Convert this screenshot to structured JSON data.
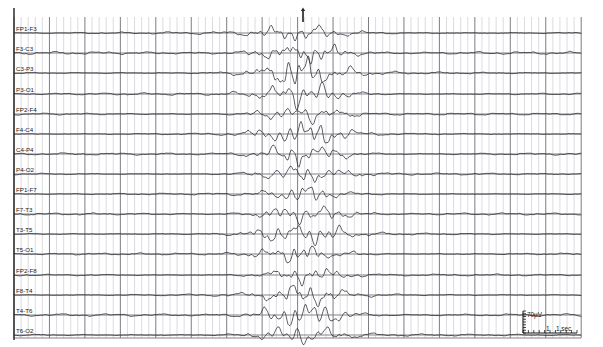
{
  "recording": {
    "title": "EEG trace page",
    "left_border_x": 14,
    "grid": {
      "x0": 14,
      "x1": 581,
      "y0": 17,
      "y1": 338,
      "minor_step_x": 7.09,
      "major_every_x": 5,
      "row_height": 20.07,
      "minor_color": "#c9c9cf",
      "major_color": "#6e6e76",
      "row_color": "#6e6e76",
      "grid_on": true
    },
    "event_marker": {
      "name": "event-tick",
      "x": 303,
      "y_top": 10,
      "y_bottom": 22,
      "label": ""
    },
    "calibration": {
      "amplitude_label": "70µV",
      "time_label": "1 sec",
      "x": 523,
      "y": 311,
      "width": 54,
      "height": 22
    }
  },
  "chart_data": {
    "type": "line",
    "xlabel": "Time (1 sec per 5 major divisions)",
    "ylabel": "Channel (70 µV calibration)",
    "grid": true,
    "legend_position": "none",
    "sampling_note": "trace amplitude in px relative to each channel baseline",
    "x_range_px": [
      14,
      581
    ],
    "channels": [
      {
        "label": "FP1-F3",
        "baseline_y": 33,
        "amp": 3.2,
        "burst_amp": 3.6
      },
      {
        "label": "F3-C3",
        "baseline_y": 53,
        "amp": 3.4,
        "burst_amp": 5.0
      },
      {
        "label": "C3-P3",
        "baseline_y": 73,
        "amp": 3.0,
        "burst_amp": 6.4
      },
      {
        "label": "P3-O1",
        "baseline_y": 94,
        "amp": 2.8,
        "burst_amp": 5.4
      },
      {
        "label": "FP2-F4",
        "baseline_y": 114,
        "amp": 2.6,
        "burst_amp": 4.2
      },
      {
        "label": "F4-C4",
        "baseline_y": 134,
        "amp": 2.8,
        "burst_amp": 4.8
      },
      {
        "label": "C4-P4",
        "baseline_y": 154,
        "amp": 2.6,
        "burst_amp": 5.2
      },
      {
        "label": "P4-O2",
        "baseline_y": 174,
        "amp": 2.4,
        "burst_amp": 4.0
      },
      {
        "label": "FP1-F7",
        "baseline_y": 194,
        "amp": 2.2,
        "burst_amp": 3.2
      },
      {
        "label": "F7-T3",
        "baseline_y": 214,
        "amp": 2.6,
        "burst_amp": 4.4
      },
      {
        "label": "T3-T5",
        "baseline_y": 234,
        "amp": 2.8,
        "burst_amp": 5.0
      },
      {
        "label": "T5-O1",
        "baseline_y": 254,
        "amp": 2.4,
        "burst_amp": 4.0
      },
      {
        "label": "FP2-F8",
        "baseline_y": 275,
        "amp": 2.2,
        "burst_amp": 3.4
      },
      {
        "label": "F8-T4",
        "baseline_y": 295,
        "amp": 2.8,
        "burst_amp": 4.6
      },
      {
        "label": "T4-T6",
        "baseline_y": 315,
        "amp": 3.0,
        "burst_amp": 5.6
      },
      {
        "label": "T6-O2",
        "baseline_y": 335,
        "amp": 2.6,
        "burst_amp": 4.4
      },
      {
        "label": "EKG (x3)",
        "baseline_y": 355,
        "amp": 0.9,
        "burst_amp": 0.9
      }
    ],
    "burst": {
      "start_x": 238,
      "peak_x": 303,
      "end_x": 380,
      "description": "generalized rhythmic burst / spike-and-wave discharge"
    }
  }
}
